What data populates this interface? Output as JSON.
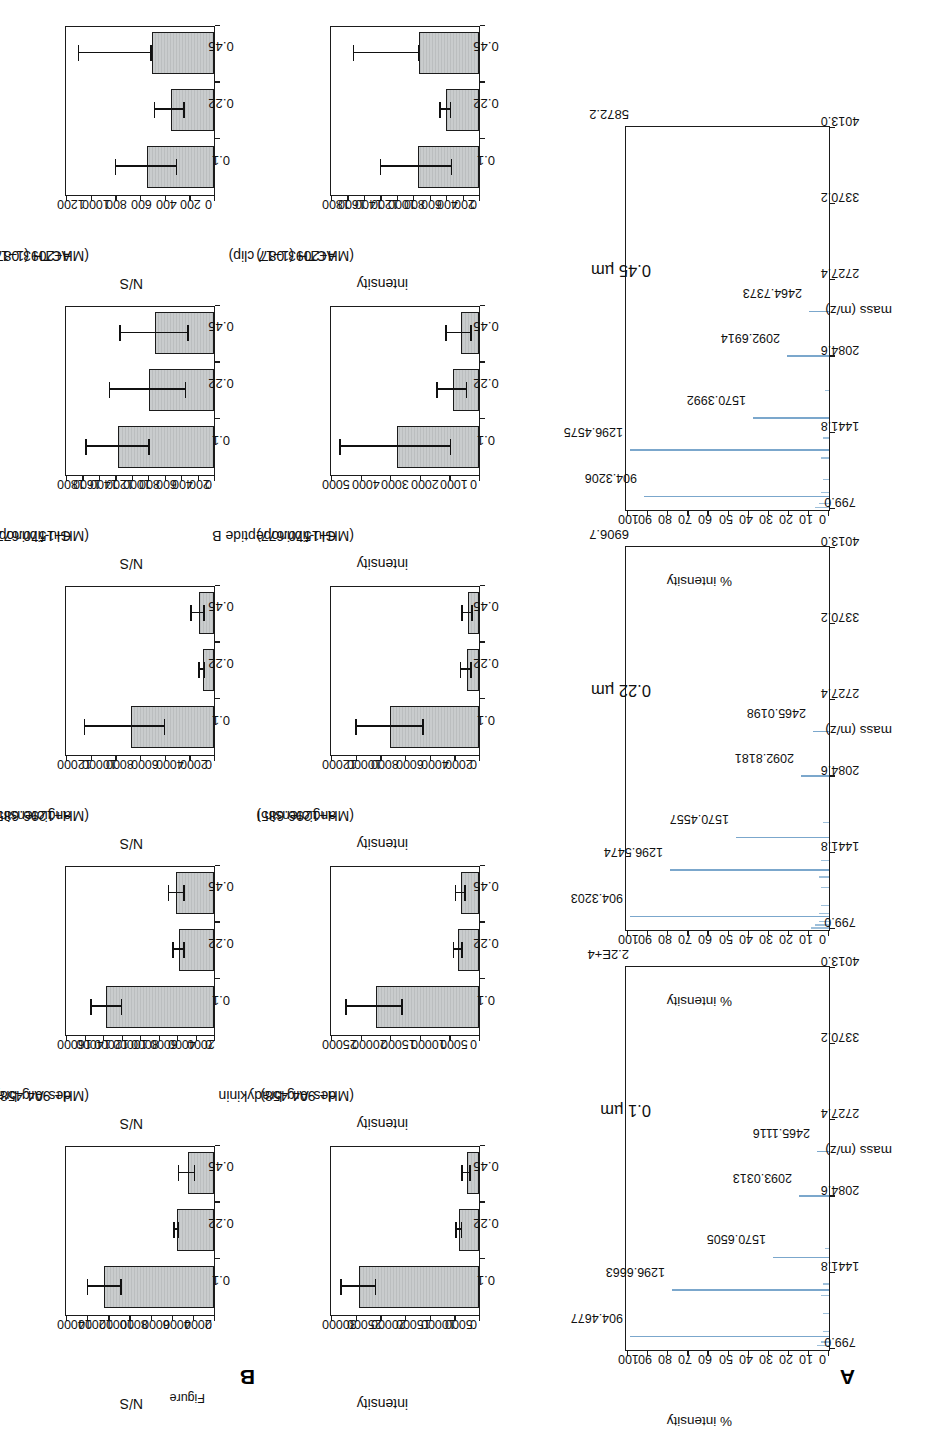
{
  "figure": {
    "panelA_letter": "A",
    "panelB_letter": "B",
    "caption_fragment": "Figure"
  },
  "spectra": {
    "yaxis_title": "% intensity",
    "xaxis_title": "mass (m/z)",
    "yticks": [
      "100",
      "90",
      "80",
      "70",
      "60",
      "50",
      "40",
      "30",
      "20",
      "10",
      "0"
    ],
    "xticks": [
      "799.0",
      "1441.8",
      "2084.6",
      "2727.4",
      "3370.2",
      "4013.0"
    ],
    "panels": [
      {
        "title": "0.1 µm",
        "max_label": "2.2E+4",
        "peaks": [
          {
            "label": "904.4677",
            "mz": 904.4677,
            "intensity": 100
          },
          {
            "label": "1296.6663",
            "mz": 1296.6663,
            "intensity": 79
          },
          {
            "label": "1570.6505",
            "mz": 1570.6505,
            "intensity": 28
          },
          {
            "label": "2093.0313",
            "mz": 2093.0313,
            "intensity": 15
          },
          {
            "label": "2465.1116",
            "mz": 2465.1116,
            "intensity": 6
          }
        ],
        "minor_peaks": [
          {
            "mz": 830,
            "intensity": 6
          },
          {
            "mz": 860,
            "intensity": 4
          },
          {
            "mz": 950,
            "intensity": 3
          },
          {
            "mz": 1100,
            "intensity": 3
          },
          {
            "mz": 1250,
            "intensity": 4
          },
          {
            "mz": 1350,
            "intensity": 3
          },
          {
            "mz": 1650,
            "intensity": 2
          }
        ]
      },
      {
        "title": "0.22 µm",
        "max_label": "6906.7",
        "peaks": [
          {
            "label": "904.3203",
            "mz": 904.3203,
            "intensity": 100
          },
          {
            "label": "1296.5474",
            "mz": 1296.5474,
            "intensity": 80
          },
          {
            "label": "1570.4557",
            "mz": 1570.4557,
            "intensity": 47
          },
          {
            "label": "2092.8181",
            "mz": 2092.8181,
            "intensity": 14
          },
          {
            "label": "2465.0198",
            "mz": 2465.0198,
            "intensity": 8
          }
        ],
        "minor_peaks": [
          {
            "mz": 810,
            "intensity": 9
          },
          {
            "mz": 835,
            "intensity": 7
          },
          {
            "mz": 865,
            "intensity": 5
          },
          {
            "mz": 930,
            "intensity": 5
          },
          {
            "mz": 1000,
            "intensity": 4
          },
          {
            "mz": 1150,
            "intensity": 4
          },
          {
            "mz": 1240,
            "intensity": 5
          },
          {
            "mz": 1380,
            "intensity": 4
          },
          {
            "mz": 1700,
            "intensity": 3
          }
        ]
      },
      {
        "title": "0.45 µm",
        "max_label": "5872.2",
        "peaks": [
          {
            "label": "904.3206",
            "mz": 904.3206,
            "intensity": 93
          },
          {
            "label": "1296.4575",
            "mz": 1296.4575,
            "intensity": 100
          },
          {
            "label": "1570.3992",
            "mz": 1570.3992,
            "intensity": 38
          },
          {
            "label": "2092.6914",
            "mz": 2092.6914,
            "intensity": 21
          },
          {
            "label": "2464.7373",
            "mz": 2464.7373,
            "intensity": 10
          }
        ],
        "minor_peaks": [
          {
            "mz": 815,
            "intensity": 7
          },
          {
            "mz": 845,
            "intensity": 5
          },
          {
            "mz": 940,
            "intensity": 4
          },
          {
            "mz": 1050,
            "intensity": 3
          },
          {
            "mz": 1230,
            "intensity": 4
          },
          {
            "mz": 1400,
            "intensity": 3
          },
          {
            "mz": 1800,
            "intensity": 2
          }
        ]
      }
    ]
  },
  "chart_data": [
    {
      "type": "bar",
      "row": "intensity",
      "title": "des-Arg-bradykinin",
      "subtitle": "(MH+ 904.458)",
      "xlabel": "",
      "ylabel": "intensity",
      "categories": [
        "0.1",
        "0.22",
        "0.45"
      ],
      "values": [
        24500,
        4000,
        2500
      ],
      "err_low": [
        21000,
        3400,
        1700
      ],
      "err_high": [
        28000,
        4600,
        3300
      ],
      "ylim": [
        0,
        30000
      ],
      "yticks": [
        "30000",
        "25000",
        "20000",
        "15000",
        "10000",
        "5000",
        "0"
      ]
    },
    {
      "type": "bar",
      "row": "intensity",
      "title": "angiotensin I",
      "subtitle": "(MH+1296.685)",
      "xlabel": "",
      "ylabel": "intensity",
      "categories": [
        "0.1",
        "0.22",
        "0.45"
      ],
      "values": [
        17500,
        3500,
        3000
      ],
      "err_low": [
        13000,
        2800,
        2300
      ],
      "err_high": [
        22500,
        4200,
        3900
      ],
      "ylim": [
        0,
        25000
      ],
      "yticks": [
        "25000",
        "20000",
        "15000",
        "10000",
        "5000",
        "0"
      ]
    },
    {
      "type": "bar",
      "row": "intensity",
      "title": "Glu-fibrinopeptide B",
      "subtitle": "(MH+1570.677)",
      "xlabel": "",
      "ylabel": "intensity",
      "categories": [
        "0.1",
        "0.22",
        "0.45"
      ],
      "values": [
        7300,
        1000,
        900
      ],
      "err_low": [
        4500,
        600,
        500
      ],
      "err_high": [
        10000,
        1450,
        1350
      ],
      "ylim": [
        0,
        12000
      ],
      "yticks": [
        "12000",
        "10000",
        "8000",
        "6000",
        "4000",
        "2000",
        "0"
      ]
    },
    {
      "type": "bar",
      "row": "intensity",
      "title": "ACTH (1–17 clip)",
      "subtitle": "(MH+2093.087)",
      "xlabel": "",
      "ylabel": "intensity",
      "categories": [
        "0.1",
        "0.22",
        "0.45"
      ],
      "values": [
        2800,
        900,
        600
      ],
      "err_low": [
        950,
        400,
        250
      ],
      "err_high": [
        4700,
        1400,
        1100
      ],
      "ylim": [
        0,
        5000
      ],
      "yticks": [
        "5000",
        "4000",
        "3000",
        "2000",
        "1000",
        "0"
      ]
    },
    {
      "type": "bar",
      "row": "intensity",
      "title": "ACTH (18–39 clip)",
      "subtitle": "(MH+ 2465.199)",
      "xlabel": "",
      "ylabel": "intensity",
      "categories": [
        "0.1",
        "0.22",
        "0.45"
      ],
      "values": [
        750,
        400,
        730
      ],
      "err_low": [
        330,
        340,
        730
      ],
      "err_high": [
        1200,
        470,
        1530
      ],
      "ylim": [
        0,
        1800
      ],
      "yticks": [
        "1800",
        "1600",
        "1400",
        "1200",
        "1000",
        "800",
        "600",
        "400",
        "200",
        "0"
      ]
    },
    {
      "type": "bar",
      "row": "ns",
      "title": "des-Arg-bradykinin",
      "subtitle": "(MH+ 904.458)",
      "xlabel": "",
      "ylabel": "N/S",
      "categories": [
        "0.1",
        "0.22",
        "0.45"
      ],
      "values": [
        10500,
        3500,
        2500
      ],
      "err_low": [
        8800,
        3300,
        1800
      ],
      "err_high": [
        12000,
        3750,
        3300
      ],
      "ylim": [
        0,
        14000
      ],
      "yticks": [
        "14000",
        "12000",
        "10000",
        "8000",
        "6000",
        "4000",
        "2000",
        "0"
      ]
    },
    {
      "type": "bar",
      "row": "ns",
      "title": "angiotensin I",
      "subtitle": "(MH+1296.685)",
      "xlabel": "",
      "ylabel": "N/S",
      "categories": [
        "0.1",
        "0.22",
        "0.45"
      ],
      "values": [
        11800,
        3800,
        4100
      ],
      "err_low": [
        10000,
        3200,
        3200
      ],
      "err_high": [
        13300,
        4400,
        4900
      ],
      "ylim": [
        0,
        16000
      ],
      "yticks": [
        "16000",
        "14000",
        "12000",
        "10000",
        "8000",
        "6000",
        "4000",
        "2000",
        "0"
      ]
    },
    {
      "type": "bar",
      "row": "ns",
      "title": "Glu-fibrinopeptide B",
      "subtitle": "(MH+1570.677)",
      "xlabel": "",
      "ylabel": "N/S",
      "categories": [
        "0.1",
        "0.22",
        "0.45"
      ],
      "values": [
        6800,
        900,
        1200
      ],
      "err_low": [
        4000,
        700,
        750
      ],
      "err_high": [
        10500,
        1150,
        1800
      ],
      "ylim": [
        0,
        12000
      ],
      "yticks": [
        "12000",
        "10000",
        "8000",
        "6000",
        "4000",
        "2000",
        "0"
      ]
    },
    {
      "type": "bar",
      "row": "ns",
      "title": "ACTH (1–17 clip)",
      "subtitle": "(MH+2093.087)",
      "xlabel": "",
      "ylabel": "N/S",
      "categories": [
        "0.1",
        "0.22",
        "0.45"
      ],
      "values": [
        1180,
        800,
        720
      ],
      "err_low": [
        790,
        340,
        310
      ],
      "err_high": [
        1560,
        1270,
        1140
      ],
      "ylim": [
        0,
        1800
      ],
      "yticks": [
        "1800",
        "1600",
        "1400",
        "1200",
        "1000",
        "800",
        "600",
        "400",
        "200",
        "0"
      ]
    },
    {
      "type": "bar",
      "row": "ns",
      "title": "ACTH (18–39 clip)",
      "subtitle": "(MH+ 2465.199)",
      "xlabel": "",
      "ylabel": "N/S",
      "categories": [
        "0.1",
        "0.22",
        "0.45"
      ],
      "values": [
        550,
        350,
        510
      ],
      "err_low": [
        300,
        240,
        510
      ],
      "err_high": [
        800,
        480,
        1100
      ],
      "ylim": [
        0,
        1200
      ],
      "yticks": [
        "1200",
        "1000",
        "800",
        "600",
        "400",
        "200",
        "0"
      ]
    }
  ]
}
